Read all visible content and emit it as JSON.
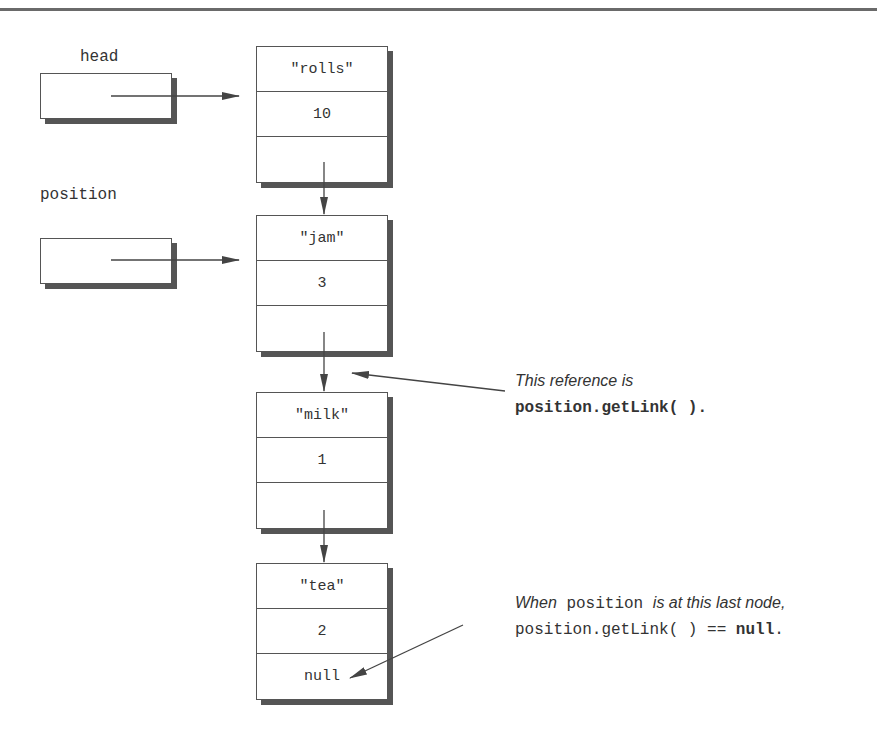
{
  "diagram": {
    "type": "linked-list",
    "references": [
      {
        "name": "head",
        "points_to": 0
      },
      {
        "name": "position",
        "points_to": 1
      }
    ],
    "nodes": [
      {
        "item": "\"rolls\"",
        "count": "10",
        "link": ""
      },
      {
        "item": "\"jam\"",
        "count": "3",
        "link": ""
      },
      {
        "item": "\"milk\"",
        "count": "1",
        "link": ""
      },
      {
        "item": "\"tea\"",
        "count": "2",
        "link": "null"
      }
    ],
    "annotations": [
      {
        "line1_italic": "This reference is",
        "line2_code": "position.getLink( )",
        "line2_end": "."
      },
      {
        "line1_italic_a": "When",
        "line1_code": "position",
        "line1_italic_b": "is at this last node,",
        "line2_code_a": "position.getLink( ) ==",
        "line2_code_bold": "null",
        "line2_end": "."
      }
    ],
    "colors": {
      "line": "#555555",
      "shadow": "#555555",
      "text": "#333333",
      "rule": "#6a6a6a"
    }
  }
}
